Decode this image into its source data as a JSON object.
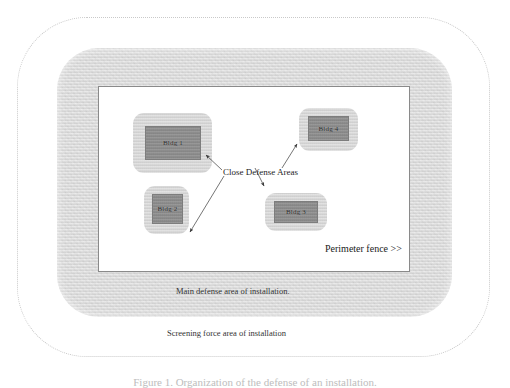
{
  "figure": {
    "caption": "Figure 1. Organization of the defense of an installation."
  },
  "zones": {
    "screening": {
      "name": "screening-force-area",
      "label": "Screening force area of installation",
      "border_style": "dotted",
      "border_color": "#c9c9c9"
    },
    "main_defense": {
      "name": "main-defense-area",
      "label": "Main defense area of installation.",
      "fill_color": "#dddddd"
    },
    "perimeter": {
      "name": "perimeter-fence-area",
      "label": "Perimeter fence >>",
      "fill_color": "#ffffff",
      "border_color": "#8a8a8a"
    }
  },
  "close_defense": {
    "label": "Close Defense Areas",
    "area_fill_color": "#d6d6d6",
    "building_fill_color": "#8f8f8f",
    "areas": [
      {
        "id": "cda-1",
        "building_label": "Bldg 1"
      },
      {
        "id": "cda-2",
        "building_label": "Bldg 2"
      },
      {
        "id": "cda-3",
        "building_label": "Bldg 3"
      },
      {
        "id": "cda-4",
        "building_label": "Bldg 4"
      }
    ]
  }
}
